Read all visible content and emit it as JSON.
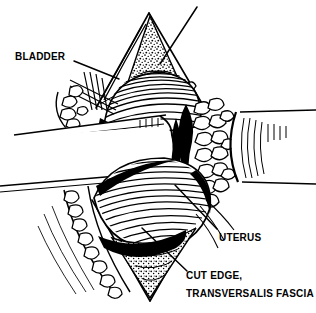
{
  "figure": {
    "kind": "surgical-line-illustration",
    "background_color": "#ffffff",
    "ink_color": "#000000",
    "width": 316,
    "height": 313
  },
  "labels": {
    "bladder": "BLADDER",
    "uterus": "UTERUS",
    "cut_edge": "CUT EDGE,",
    "transversalis_fascia": "TRANSVERSALIS FASCIA"
  },
  "leader_lines": [
    {
      "name": "bladder-leader",
      "from": [
        74,
        62
      ],
      "to": [
        118,
        78
      ]
    },
    {
      "name": "uterus-leader",
      "from": [
        216,
        230
      ],
      "to": [
        176,
        186
      ]
    },
    {
      "name": "cut-edge-leader",
      "from": [
        186,
        272
      ],
      "to": [
        144,
        230
      ]
    },
    {
      "name": "fascia-top-leader",
      "from": [
        196,
        8
      ],
      "to": [
        163,
        62
      ]
    }
  ],
  "structures": [
    {
      "name": "retractor-blade-left",
      "note": "broad white band crossing left half"
    },
    {
      "name": "retractor-blade-right",
      "note": "broad white band crossing right half"
    },
    {
      "name": "uterus-upper-body",
      "note": "curved hatched dome above retractors"
    },
    {
      "name": "uterus-lower-body",
      "note": "large rounded hatched mass below retractors"
    },
    {
      "name": "fat-lobules-right",
      "note": "cluster of outlined blobs right of midline"
    },
    {
      "name": "fat-lobules-lower-left",
      "note": "chain of outlined blobs along lower left margin"
    },
    {
      "name": "cut-fascia-wedge-top",
      "note": "stippled triangular flap at top"
    },
    {
      "name": "cut-fascia-wedge-bottom",
      "note": "stippled wedge at bottom"
    },
    {
      "name": "midline-shadow",
      "note": "dark vertical cleft at center"
    }
  ]
}
